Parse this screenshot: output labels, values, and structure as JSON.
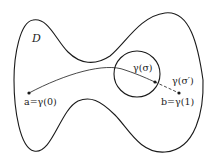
{
  "diagram": {
    "type": "region-with-path",
    "region_label": "D",
    "labels": {
      "region": "D",
      "start_point": "a=γ(0)",
      "end_point": "b=γ(1)",
      "sigma_point": "γ(σ)",
      "sigma_prime_point": "γ(σ′)"
    },
    "elements": {
      "region_outline": "closed dumbbell-shaped curve",
      "circle": "disk around γ(σ)",
      "path_solid": "curve from a to γ(σ)",
      "path_dashed": "segment from γ(σ) to b"
    },
    "colors": {
      "stroke": "#1a1a1a",
      "background": "#ffffff",
      "text": "#222222"
    }
  }
}
